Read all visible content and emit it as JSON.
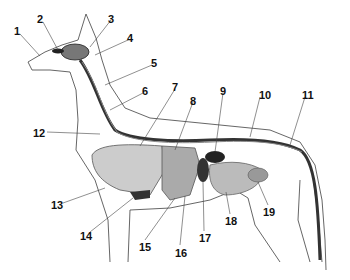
{
  "diagram": {
    "labels": [
      {
        "n": "1",
        "x": 14,
        "y": 26
      },
      {
        "n": "2",
        "x": 37,
        "y": 14
      },
      {
        "n": "3",
        "x": 108,
        "y": 14
      },
      {
        "n": "4",
        "x": 127,
        "y": 33
      },
      {
        "n": "5",
        "x": 151,
        "y": 58
      },
      {
        "n": "6",
        "x": 142,
        "y": 86
      },
      {
        "n": "7",
        "x": 172,
        "y": 82
      },
      {
        "n": "8",
        "x": 190,
        "y": 96
      },
      {
        "n": "9",
        "x": 220,
        "y": 86
      },
      {
        "n": "10",
        "x": 259,
        "y": 90
      },
      {
        "n": "11",
        "x": 302,
        "y": 90
      },
      {
        "n": "12",
        "x": 33,
        "y": 128
      },
      {
        "n": "13",
        "x": 51,
        "y": 200
      },
      {
        "n": "14",
        "x": 80,
        "y": 231
      },
      {
        "n": "15",
        "x": 139,
        "y": 242
      },
      {
        "n": "16",
        "x": 175,
        "y": 248
      },
      {
        "n": "17",
        "x": 199,
        "y": 233
      },
      {
        "n": "18",
        "x": 225,
        "y": 216
      },
      {
        "n": "19",
        "x": 263,
        "y": 207
      }
    ]
  }
}
